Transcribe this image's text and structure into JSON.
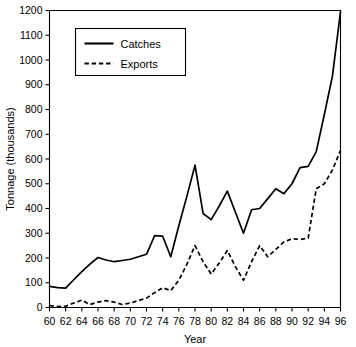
{
  "chart_data": {
    "type": "line",
    "title": "",
    "xlabel": "Year",
    "ylabel": "Tonnage (thousands)",
    "xlim": [
      60,
      96
    ],
    "ylim": [
      0,
      1200
    ],
    "grid": false,
    "legend_position": "top-left-inside",
    "x_tick_labels": [
      "60",
      "62",
      "64",
      "66",
      "68",
      "70",
      "72",
      "74",
      "76",
      "78",
      "80",
      "82",
      "84",
      "86",
      "88",
      "90",
      "92",
      "94",
      "96"
    ],
    "x_tick_values": [
      60,
      62,
      64,
      66,
      68,
      70,
      72,
      74,
      76,
      78,
      80,
      82,
      84,
      86,
      88,
      90,
      92,
      94,
      96
    ],
    "y_tick_labels": [
      "0",
      "100",
      "200",
      "300",
      "400",
      "500",
      "600",
      "700",
      "800",
      "900",
      "1000",
      "1100",
      "1200"
    ],
    "y_tick_values": [
      0,
      100,
      200,
      300,
      400,
      500,
      600,
      700,
      800,
      900,
      1000,
      1100,
      1200
    ],
    "x": [
      60,
      61,
      62,
      63,
      64,
      65,
      66,
      67,
      68,
      69,
      70,
      71,
      72,
      73,
      74,
      75,
      76,
      77,
      78,
      79,
      80,
      81,
      82,
      83,
      84,
      85,
      86,
      87,
      88,
      89,
      90,
      91,
      92,
      93,
      94,
      95,
      96
    ],
    "series": [
      {
        "name": "Catches",
        "style": "solid",
        "color": "#000000",
        "values": [
          85,
          80,
          78,
          112,
          145,
          175,
          202,
          192,
          185,
          190,
          195,
          205,
          215,
          290,
          288,
          205,
          330,
          450,
          575,
          380,
          355,
          410,
          470,
          385,
          300,
          395,
          400,
          440,
          480,
          460,
          500,
          565,
          570,
          630,
          780,
          935,
          1195
        ]
      },
      {
        "name": "Exports",
        "style": "dashed",
        "color": "#000000",
        "values": [
          8,
          4,
          5,
          18,
          30,
          12,
          22,
          28,
          22,
          12,
          18,
          28,
          38,
          60,
          80,
          68,
          110,
          175,
          250,
          185,
          135,
          180,
          230,
          165,
          110,
          185,
          250,
          205,
          235,
          265,
          278,
          275,
          280,
          480,
          500,
          555,
          635
        ]
      }
    ]
  },
  "legend": {
    "entries": [
      {
        "label": "Catches"
      },
      {
        "label": "Exports"
      }
    ]
  }
}
